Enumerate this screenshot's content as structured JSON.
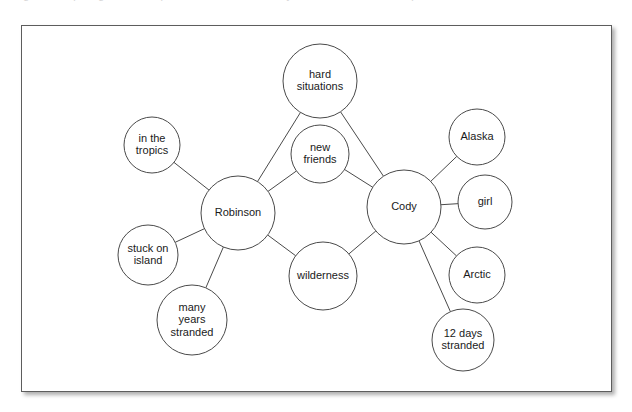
{
  "page": {
    "background_color": "#ffffff",
    "cutoff_line_text": "Figure: comparing survival experiences of two castaways in a double bubble map"
  },
  "figure_card": {
    "border_color": "#5d5d5d",
    "background_color": "#ffffff",
    "shadow": true
  },
  "diagram": {
    "type": "double-bubble-map",
    "hub_stroke_color": "#1c1c1c",
    "node_stroke_color": "#4a4a4a",
    "edge_color": "#4a4a4a",
    "hubs": [
      {
        "id": "robinson",
        "label": "Robinson",
        "lines": [
          "Robinson"
        ],
        "cx": 238,
        "cy": 213,
        "r": 37
      },
      {
        "id": "cody",
        "label": "Cody",
        "lines": [
          "Cody"
        ],
        "cx": 404,
        "cy": 207,
        "r": 37
      }
    ],
    "nodes": [
      {
        "id": "hard-situations",
        "label": "hard situations",
        "lines": [
          "hard",
          "situations"
        ],
        "cx": 320,
        "cy": 81,
        "r": 37
      },
      {
        "id": "new-friends",
        "label": "new friends",
        "lines": [
          "new",
          "friends"
        ],
        "cx": 320,
        "cy": 154,
        "r": 29
      },
      {
        "id": "wilderness",
        "label": "wilderness",
        "lines": [
          "wilderness"
        ],
        "cx": 323,
        "cy": 276,
        "r": 34
      },
      {
        "id": "in-the-tropics",
        "label": "in the tropics",
        "lines": [
          "in the",
          "tropics"
        ],
        "cx": 152,
        "cy": 145,
        "r": 28
      },
      {
        "id": "stuck-on-island",
        "label": "stuck on island",
        "lines": [
          "stuck on",
          "island"
        ],
        "cx": 148,
        "cy": 255,
        "r": 30
      },
      {
        "id": "many-years-stranded",
        "label": "many years stranded",
        "lines": [
          "many",
          "years",
          "stranded"
        ],
        "cx": 192,
        "cy": 320,
        "r": 35
      },
      {
        "id": "alaska",
        "label": "Alaska",
        "lines": [
          "Alaska"
        ],
        "cx": 477,
        "cy": 137,
        "r": 28
      },
      {
        "id": "girl",
        "label": "girl",
        "lines": [
          "girl"
        ],
        "cx": 485,
        "cy": 202,
        "r": 27
      },
      {
        "id": "arctic",
        "label": "Arctic",
        "lines": [
          "Arctic"
        ],
        "cx": 477,
        "cy": 275,
        "r": 28
      },
      {
        "id": "12-days-stranded",
        "label": "12 days stranded",
        "lines": [
          "12 days",
          "stranded"
        ],
        "cx": 463,
        "cy": 340,
        "r": 31
      }
    ],
    "edges": [
      {
        "from": "robinson",
        "to": "hard-situations"
      },
      {
        "from": "robinson",
        "to": "new-friends"
      },
      {
        "from": "robinson",
        "to": "wilderness"
      },
      {
        "from": "robinson",
        "to": "in-the-tropics"
      },
      {
        "from": "robinson",
        "to": "stuck-on-island"
      },
      {
        "from": "robinson",
        "to": "many-years-stranded"
      },
      {
        "from": "cody",
        "to": "hard-situations"
      },
      {
        "from": "cody",
        "to": "new-friends"
      },
      {
        "from": "cody",
        "to": "wilderness"
      },
      {
        "from": "cody",
        "to": "alaska"
      },
      {
        "from": "cody",
        "to": "girl"
      },
      {
        "from": "cody",
        "to": "arctic"
      },
      {
        "from": "cody",
        "to": "12-days-stranded"
      }
    ]
  }
}
